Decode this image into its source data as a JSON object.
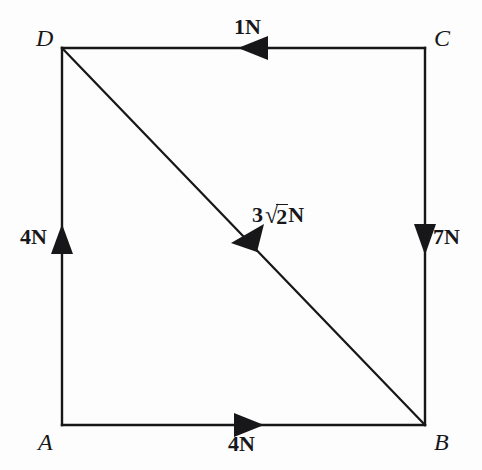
{
  "figure": {
    "background_color": "#fdfdfd",
    "stroke_color": "#17171a",
    "vertices": [
      {
        "name": "A",
        "label": "A",
        "x": 62,
        "y": 425,
        "label_x": 38,
        "label_y": 430,
        "position": "bottom-left"
      },
      {
        "name": "B",
        "label": "B",
        "x": 425,
        "y": 425,
        "label_x": 434,
        "label_y": 430,
        "position": "bottom-right"
      },
      {
        "name": "C",
        "label": "C",
        "x": 425,
        "y": 48,
        "label_x": 434,
        "label_y": 26,
        "position": "top-right"
      },
      {
        "name": "D",
        "label": "D",
        "x": 62,
        "y": 48,
        "label_x": 36,
        "label_y": 26,
        "position": "top-left"
      }
    ],
    "edges": [
      {
        "name": "edge-AB",
        "from": "A",
        "to": "B",
        "x1": 62,
        "y1": 425,
        "x2": 425,
        "y2": 425
      },
      {
        "name": "edge-BC",
        "from": "B",
        "to": "C",
        "x1": 425,
        "y1": 425,
        "x2": 425,
        "y2": 48
      },
      {
        "name": "edge-CD",
        "from": "C",
        "to": "D",
        "x1": 425,
        "y1": 48,
        "x2": 62,
        "y2": 48
      },
      {
        "name": "edge-DA",
        "from": "D",
        "to": "A",
        "x1": 62,
        "y1": 48,
        "x2": 62,
        "y2": 425
      },
      {
        "name": "diagonal-DB",
        "from": "D",
        "to": "B",
        "x1": 62,
        "y1": 48,
        "x2": 425,
        "y2": 425
      }
    ],
    "forces": [
      {
        "name": "force-top",
        "edge": "CD",
        "magnitude": "1N",
        "value": 1,
        "unit": "N",
        "direction": "left",
        "direction_note": "along DC pointing from C toward D",
        "arrow_x": 252,
        "arrow_y": 48,
        "label_x": 234,
        "label_y": 16
      },
      {
        "name": "force-left",
        "edge": "AD",
        "magnitude": "4N",
        "value": 4,
        "unit": "N",
        "direction": "up",
        "direction_note": "along AD pointing from A toward D",
        "arrow_x": 62,
        "arrow_y": 240,
        "label_x": 20,
        "label_y": 226
      },
      {
        "name": "force-right",
        "edge": "CB",
        "magnitude": "7N",
        "value": 7,
        "unit": "N",
        "direction": "down",
        "direction_note": "along CB pointing from C toward B",
        "arrow_x": 425,
        "arrow_y": 238,
        "label_x": 433,
        "label_y": 226
      },
      {
        "name": "force-bottom",
        "edge": "AB",
        "magnitude": "4N",
        "value": 4,
        "unit": "N",
        "direction": "right",
        "direction_note": "along AB pointing from A toward B",
        "arrow_x": 248,
        "arrow_y": 425,
        "label_x": 228,
        "label_y": 433
      },
      {
        "name": "force-diagonal",
        "edge": "BD",
        "magnitude": "3√2N",
        "magnitude_parts": {
          "coefficient": "3",
          "radical": "√",
          "radicand": "2",
          "unit": "N"
        },
        "value": 4.2426,
        "unit": "N",
        "direction": "down-left",
        "direction_note": "along BD pointing from B toward D",
        "arrow_x": 244,
        "arrow_y": 237,
        "label_x": 252,
        "label_y": 204
      }
    ]
  }
}
